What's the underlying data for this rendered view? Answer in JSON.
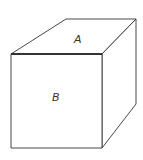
{
  "diagram": {
    "type": "cube-line-drawing",
    "faces": [
      {
        "id": "top",
        "label": "A"
      },
      {
        "id": "front",
        "label": "B"
      }
    ],
    "colors": {
      "stroke": "#333333",
      "background": "#ffffff"
    }
  }
}
